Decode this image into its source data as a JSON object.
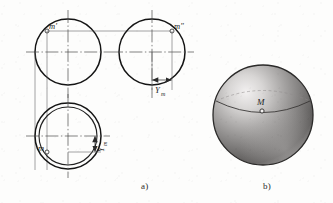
{
  "figure": {
    "caption_a": "a)",
    "caption_b": "b)",
    "labels": {
      "m_prime": "m'",
      "m_double_prime": "mʺ",
      "m_plain": "m",
      "M_point": "M",
      "y_dim_front": "Y",
      "y_dim_front_sub": "m",
      "y_dim_top": "Y",
      "y_dim_top_sub": "m"
    },
    "colors": {
      "ink": "#1a1a1a",
      "thin_line": "#4a4a4a",
      "center_line": "#555555",
      "paper": "#fdfdfc",
      "sphere_light": "#eceaea",
      "sphere_mid": "#9a9897",
      "sphere_dark": "#4e4c4b",
      "sphere_edge": "#2b2a29"
    },
    "geometry": {
      "front_view": {
        "cx": 68,
        "cy": 52,
        "r": 33
      },
      "side_view": {
        "cx": 152,
        "cy": 52,
        "r": 33
      },
      "top_view": {
        "cx": 68,
        "cy": 136,
        "r": 33,
        "r_inner": 29
      },
      "sphere": {
        "cx": 263,
        "cy": 115,
        "r": 50
      },
      "point_m_prime": {
        "x": 47,
        "y": 31
      },
      "point_m_double_prime": {
        "x": 172,
        "y": 31
      },
      "point_m_top": {
        "x": 47,
        "y": 152
      },
      "point_M_sphere": {
        "x": 262,
        "y": 103
      }
    }
  }
}
